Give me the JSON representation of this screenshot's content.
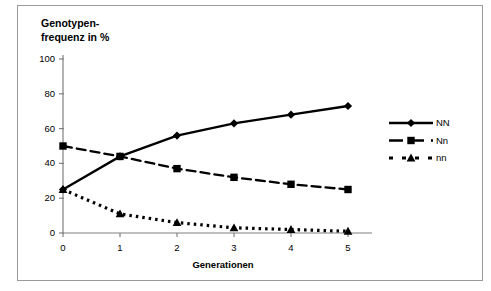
{
  "chart_data": {
    "type": "line",
    "title": "",
    "ylabel": "Genotypen-\nfrequenz in %",
    "xlabel": "Generationen",
    "categories": [
      "0",
      "1",
      "2",
      "3",
      "4",
      "5"
    ],
    "x": [
      0,
      1,
      2,
      3,
      4,
      5
    ],
    "xlim": [
      0,
      5
    ],
    "ylim": [
      0,
      100
    ],
    "yticks": [
      "0",
      "20",
      "40",
      "60",
      "80",
      "100"
    ],
    "ytick_values": [
      0,
      20,
      40,
      60,
      80,
      100
    ],
    "xticks": [
      "0",
      "1",
      "2",
      "3",
      "4",
      "5"
    ],
    "grid": false,
    "legend_position": "right",
    "series": [
      {
        "name": "NN",
        "marker": "diamond",
        "linestyle": "solid",
        "color": "#000000",
        "values": [
          25,
          44,
          56,
          63,
          68,
          73
        ]
      },
      {
        "name": "Nn",
        "marker": "square",
        "linestyle": "dashed",
        "color": "#000000",
        "values": [
          50,
          44,
          37,
          32,
          28,
          25
        ]
      },
      {
        "name": "nn",
        "marker": "triangle",
        "linestyle": "dotted",
        "color": "#000000",
        "values": [
          25,
          11,
          6,
          3,
          2,
          1
        ]
      }
    ]
  },
  "legend": {
    "items": [
      {
        "label": "NN"
      },
      {
        "label": "Nn"
      },
      {
        "label": "nn"
      }
    ]
  }
}
